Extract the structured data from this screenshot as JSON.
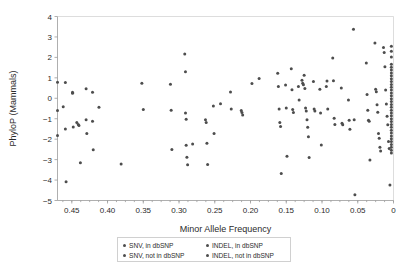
{
  "chart_data": {
    "type": "scatter",
    "title": "",
    "xlabel": "Minor Allele Frequency",
    "ylabel": "PhyloP (Mammals)",
    "xlim": [
      0.47,
      0.0
    ],
    "ylim": [
      -5,
      4
    ],
    "x_reversed": true,
    "grid": false,
    "legend_position": "below-axis",
    "xticks": [
      "0.45",
      "0.40",
      "0.35",
      "0.30",
      "0.25",
      "0.20",
      "0.15",
      "0.10",
      "0.05",
      "0"
    ],
    "xtick_values": [
      0.45,
      0.4,
      0.35,
      0.3,
      0.25,
      0.2,
      0.15,
      0.1,
      0.05,
      0.0
    ],
    "yticks": [
      "4",
      "3",
      "2",
      "1",
      "0",
      "-1",
      "-2",
      "-3",
      "-4",
      "-5"
    ],
    "ytick_values": [
      4,
      3,
      2,
      1,
      0,
      -1,
      -2,
      -3,
      -4,
      -5
    ],
    "marker_color": "#4d4d4d",
    "marker_size": 2.0,
    "series": [
      {
        "name": "SNV, in dbSNP",
        "marker": "dot",
        "color": "#4d4d4d",
        "points": [
          [
            0.47,
            0.78
          ],
          [
            0.47,
            -0.6
          ],
          [
            0.47,
            -1.82
          ],
          [
            0.462,
            -0.42
          ],
          [
            0.459,
            0.77
          ],
          [
            0.459,
            -1.5
          ],
          [
            0.458,
            -4.08
          ],
          [
            0.449,
            0.3
          ],
          [
            0.449,
            0.25
          ],
          [
            0.448,
            -1.4
          ],
          [
            0.443,
            -1.18
          ],
          [
            0.441,
            -1.28
          ],
          [
            0.44,
            -1.33
          ],
          [
            0.438,
            -3.15
          ],
          [
            0.43,
            0.47
          ],
          [
            0.43,
            -1.05
          ],
          [
            0.429,
            -1.72
          ],
          [
            0.421,
            0.3
          ],
          [
            0.421,
            -1.12
          ],
          [
            0.42,
            -2.52
          ],
          [
            0.412,
            -0.44
          ],
          [
            0.381,
            -3.22
          ],
          [
            0.352,
            0.74
          ],
          [
            0.35,
            -0.55
          ],
          [
            0.312,
            0.69
          ],
          [
            0.311,
            -0.58
          ],
          [
            0.31,
            -2.5
          ],
          [
            0.292,
            2.17
          ],
          [
            0.291,
            1.3
          ],
          [
            0.291,
            -0.72
          ],
          [
            0.29,
            -1.02
          ],
          [
            0.29,
            -2.3
          ],
          [
            0.289,
            -2.88
          ],
          [
            0.288,
            -3.25
          ],
          [
            0.281,
            -2.24
          ],
          [
            0.263,
            -1.05
          ],
          [
            0.262,
            -1.18
          ],
          [
            0.261,
            -2.2
          ],
          [
            0.26,
            -3.24
          ],
          [
            0.252,
            -0.38
          ],
          [
            0.251,
            -1.72
          ],
          [
            0.242,
            -0.27
          ],
          [
            0.228,
            0.31
          ],
          [
            0.227,
            -0.52
          ],
          [
            0.213,
            -0.6
          ],
          [
            0.212,
            -0.7
          ],
          [
            0.211,
            -0.82
          ],
          [
            0.198,
            0.72
          ],
          [
            0.188,
            0.97
          ]
        ]
      },
      {
        "name": "SNV, not in dbSNP",
        "marker": "dot",
        "color": "#4d4d4d",
        "points": [
          [
            0.162,
            1.22
          ],
          [
            0.161,
            0.58
          ],
          [
            0.16,
            -0.52
          ],
          [
            0.159,
            -1.18
          ],
          [
            0.158,
            -1.38
          ],
          [
            0.157,
            -3.68
          ],
          [
            0.151,
            0.65
          ],
          [
            0.15,
            -0.48
          ],
          [
            0.149,
            -2.84
          ],
          [
            0.143,
            1.44
          ],
          [
            0.142,
            0.42
          ],
          [
            0.141,
            -0.55
          ],
          [
            0.14,
            -0.7
          ],
          [
            0.133,
            0.58
          ],
          [
            0.132,
            -0.08
          ],
          [
            0.128,
            0.88
          ],
          [
            0.127,
            0.74
          ],
          [
            0.126,
            0.66
          ],
          [
            0.125,
            1.13
          ],
          [
            0.124,
            0.48
          ],
          [
            0.123,
            -0.48
          ],
          [
            0.122,
            -0.62
          ],
          [
            0.121,
            -1.05
          ],
          [
            0.12,
            -1.42
          ],
          [
            0.119,
            -1.88
          ],
          [
            0.118,
            -2.9
          ],
          [
            0.112,
            0.82
          ],
          [
            0.111,
            -0.52
          ],
          [
            0.11,
            -0.62
          ],
          [
            0.103,
            0.44
          ],
          [
            0.102,
            -0.72
          ],
          [
            0.101,
            -2.28
          ],
          [
            0.094,
            0.58
          ],
          [
            0.093,
            0.84
          ],
          [
            0.092,
            -0.52
          ],
          [
            0.085,
            1.97
          ],
          [
            0.084,
            0.86
          ],
          [
            0.083,
            -0.98
          ],
          [
            0.082,
            -1.28
          ],
          [
            0.073,
            0.5
          ],
          [
            0.072,
            -1.22
          ],
          [
            0.071,
            -1.3
          ],
          [
            0.063,
            -0.08
          ],
          [
            0.062,
            -1.08
          ],
          [
            0.061,
            -1.52
          ],
          [
            0.056,
            3.38
          ],
          [
            0.055,
            -1.05
          ],
          [
            0.054,
            -4.72
          ]
        ]
      },
      {
        "name": "INDEL, in dbSNP",
        "marker": "dot",
        "color": "#4d4d4d",
        "points": [
          [
            0.038,
            1.72
          ],
          [
            0.037,
            0.18
          ],
          [
            0.036,
            -0.58
          ],
          [
            0.035,
            -1.08
          ],
          [
            0.034,
            -1.12
          ],
          [
            0.033,
            -3.02
          ],
          [
            0.026,
            2.7
          ],
          [
            0.025,
            0.44
          ],
          [
            0.024,
            0.32
          ],
          [
            0.023,
            -0.32
          ],
          [
            0.022,
            -0.68
          ],
          [
            0.021,
            -1.72
          ],
          [
            0.02,
            -1.96
          ],
          [
            0.019,
            -2.4
          ],
          [
            0.018,
            -2.58
          ],
          [
            0.014,
            2.48
          ],
          [
            0.013,
            2.24
          ],
          [
            0.012,
            1.54
          ],
          [
            0.011,
            0.4
          ],
          [
            0.01,
            -0.28
          ],
          [
            0.009,
            -0.88
          ],
          [
            0.008,
            -1.3
          ],
          [
            0.007,
            -2.12
          ],
          [
            0.006,
            -2.46
          ],
          [
            0.005,
            -4.24
          ]
        ]
      },
      {
        "name": "INDEL, not in dbSNP",
        "marker": "dot",
        "color": "#4d4d4d",
        "points": [
          [
            0.003,
            2.55
          ],
          [
            0.003,
            2.3
          ],
          [
            0.003,
            2.02
          ],
          [
            0.003,
            1.66
          ],
          [
            0.003,
            1.52
          ],
          [
            0.003,
            1.38
          ],
          [
            0.003,
            1.24
          ],
          [
            0.003,
            1.1
          ],
          [
            0.003,
            0.96
          ],
          [
            0.003,
            0.82
          ],
          [
            0.003,
            0.68
          ],
          [
            0.003,
            0.54
          ],
          [
            0.003,
            0.4
          ],
          [
            0.003,
            0.26
          ],
          [
            0.003,
            0.12
          ],
          [
            0.003,
            -0.02
          ],
          [
            0.003,
            -0.16
          ],
          [
            0.003,
            -0.3
          ],
          [
            0.003,
            -0.44
          ],
          [
            0.003,
            -0.58
          ],
          [
            0.003,
            -0.72
          ],
          [
            0.003,
            -0.86
          ],
          [
            0.003,
            -1.0
          ],
          [
            0.003,
            -1.14
          ],
          [
            0.003,
            -1.28
          ],
          [
            0.003,
            -1.42
          ],
          [
            0.003,
            -1.56
          ],
          [
            0.003,
            -1.7
          ],
          [
            0.003,
            -1.84
          ],
          [
            0.003,
            -1.98
          ],
          [
            0.003,
            -2.12
          ],
          [
            0.003,
            -2.26
          ],
          [
            0.003,
            -2.4
          ],
          [
            0.003,
            -2.54
          ],
          [
            0.003,
            -2.68
          ]
        ]
      }
    ]
  },
  "legend": {
    "entries": [
      {
        "label": "SNV, in dbSNP"
      },
      {
        "label": "INDEL, in dbSNP"
      },
      {
        "label": "SNV, not in dbSNP"
      },
      {
        "label": "INDEL, not in dbSNP"
      }
    ]
  }
}
